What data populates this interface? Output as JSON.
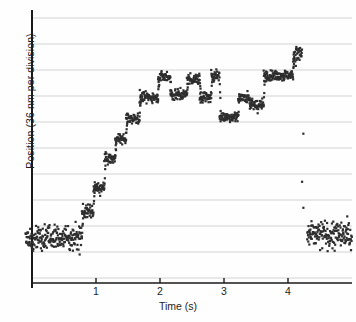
{
  "chart_data": {
    "type": "scatter",
    "title": "",
    "subtitle": "",
    "xlabel": "Time (s)",
    "ylabel": "Position (36 nm per division)",
    "xlim": [
      -0.12,
      5.05
    ],
    "ylim": [
      0,
      10
    ],
    "xticks": [
      1,
      2,
      3,
      4
    ],
    "xtick_labels": [
      "1",
      "2",
      "3",
      "4"
    ],
    "yticks": [
      0,
      1,
      2,
      3,
      4,
      5,
      6,
      7,
      8,
      9,
      10
    ],
    "ytick_labels": [
      "",
      "",
      "",
      "",
      "",
      "",
      "",
      "",
      "",
      "",
      ""
    ],
    "grid": {
      "horizontal": true,
      "vertical": false,
      "color": "#cfcfcf"
    },
    "legend": {
      "show": false,
      "position": "none"
    },
    "marker": {
      "shape": "square",
      "size": 2.2,
      "color": "#2e2e2e"
    },
    "axis_color": "#1a1a1a",
    "y_division_nm": 36,
    "series": [
      {
        "name": "bead position",
        "steps": [
          {
            "t_start": -0.1,
            "t_end": 0.78,
            "level": 1.55,
            "noise": 0.52
          },
          {
            "t_start": 0.78,
            "t_end": 0.96,
            "level": 2.55,
            "noise": 0.28
          },
          {
            "t_start": 0.96,
            "t_end": 1.13,
            "level": 3.45,
            "noise": 0.26
          },
          {
            "t_start": 1.13,
            "t_end": 1.3,
            "level": 4.58,
            "noise": 0.22
          },
          {
            "t_start": 1.3,
            "t_end": 1.47,
            "level": 5.35,
            "noise": 0.22
          },
          {
            "t_start": 1.47,
            "t_end": 1.68,
            "level": 6.15,
            "noise": 0.24
          },
          {
            "t_start": 1.68,
            "t_end": 1.97,
            "level": 6.95,
            "noise": 0.22
          },
          {
            "t_start": 1.97,
            "t_end": 2.16,
            "level": 7.75,
            "noise": 0.22
          },
          {
            "t_start": 2.16,
            "t_end": 2.42,
            "level": 7.05,
            "noise": 0.24
          },
          {
            "t_start": 2.42,
            "t_end": 2.62,
            "level": 7.65,
            "noise": 0.24
          },
          {
            "t_start": 2.62,
            "t_end": 2.8,
            "level": 6.95,
            "noise": 0.24
          },
          {
            "t_start": 2.8,
            "t_end": 2.93,
            "level": 7.8,
            "noise": 0.26
          },
          {
            "t_start": 2.93,
            "t_end": 3.22,
            "level": 6.2,
            "noise": 0.24
          },
          {
            "t_start": 3.22,
            "t_end": 3.4,
            "level": 6.95,
            "noise": 0.24
          },
          {
            "t_start": 3.4,
            "t_end": 3.62,
            "level": 6.65,
            "noise": 0.24
          },
          {
            "t_start": 3.62,
            "t_end": 4.08,
            "level": 7.8,
            "noise": 0.22
          },
          {
            "t_start": 4.08,
            "t_end": 4.22,
            "level": 8.6,
            "noise": 0.38
          },
          {
            "t_start": 4.3,
            "t_end": 5.0,
            "level": 1.65,
            "noise": 0.6
          }
        ],
        "detachment_points": [
          {
            "t": 4.24,
            "y": 5.55
          },
          {
            "t": 4.22,
            "y": 3.7
          },
          {
            "t": 4.24,
            "y": 2.7
          }
        ]
      }
    ]
  },
  "axes": {
    "y_axis_label": "Position (36 nm per division)",
    "x_axis_label": "Time (s)",
    "x_tick_1": "1",
    "x_tick_2": "2",
    "x_tick_3": "3",
    "x_tick_4": "4"
  },
  "colors": {
    "marker": "#2e2e2e",
    "grid": "#cfcfcf",
    "axis": "#1a1a1a",
    "background": "#fefefe"
  }
}
